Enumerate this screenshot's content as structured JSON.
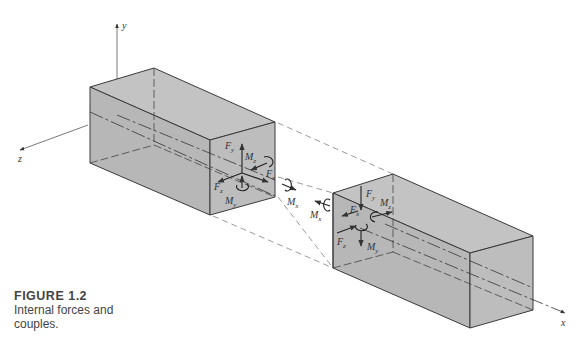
{
  "figure": {
    "number_label": "FIGURE 1.2",
    "caption_line1": "Internal forces and",
    "caption_line2": "couples."
  },
  "axes": {
    "x": "x",
    "y": "y",
    "z": "z"
  },
  "left_segment": {
    "forces": {
      "Fx": "F",
      "Fy": "F",
      "Fz": "F"
    },
    "moments": {
      "Mx": "M",
      "My": "M",
      "Mz": "M"
    },
    "subscripts": {
      "x": "x",
      "y": "y",
      "z": "z"
    }
  },
  "right_segment": {
    "forces": {
      "Fx": "F",
      "Fy": "F",
      "Fz": "F"
    },
    "moments": {
      "Mx": "M",
      "My": "M",
      "Mz": "M"
    },
    "subscripts": {
      "x": "x",
      "y": "y",
      "z": "z"
    }
  },
  "colors": {
    "box_fill": "#b9b9b9",
    "box_top": "#c4c4c4",
    "edge": "#3a3a3a",
    "text": "#333333"
  }
}
